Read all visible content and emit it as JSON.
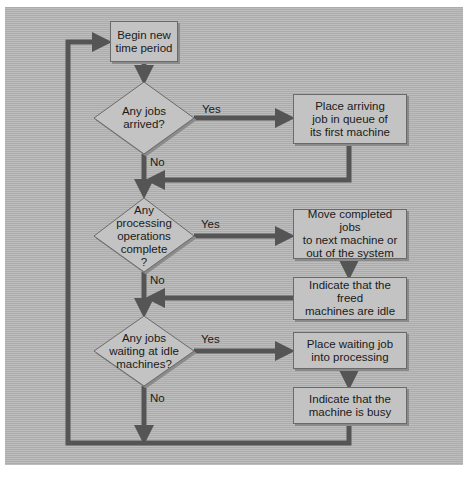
{
  "diagram": {
    "type": "flowchart",
    "colors": {
      "background": "#b4b4b4",
      "box_fill": "#c3c3c3",
      "box_border": "#6a6a6a",
      "connector": "#555555",
      "text": "#1a1a1a"
    },
    "nodes": {
      "start": {
        "shape": "rectangle",
        "text": "Begin new\ntime period"
      },
      "decision1": {
        "shape": "diamond",
        "text": "Any jobs\narrived?"
      },
      "action1": {
        "shape": "rectangle",
        "text": "Place arriving\njob in queue of\nits first machine"
      },
      "decision2": {
        "shape": "diamond",
        "text": "Any\nprocessing\noperations\ncomplete\n?"
      },
      "action2a": {
        "shape": "rectangle",
        "text": "Move completed jobs\nto next machine or\nout of the system"
      },
      "action2b": {
        "shape": "rectangle",
        "text": "Indicate that the freed\nmachines are idle"
      },
      "decision3": {
        "shape": "diamond",
        "text": "Any jobs\nwaiting at idle\nmachines?"
      },
      "action3a": {
        "shape": "rectangle",
        "text": "Place waiting job\ninto processing"
      },
      "action3b": {
        "shape": "rectangle",
        "text": "Indicate that the\nmachine is busy"
      }
    },
    "edge_labels": {
      "d1_yes": "Yes",
      "d1_no": "No",
      "d2_yes": "Yes",
      "d2_no": "No",
      "d3_yes": "Yes",
      "d3_no": "No"
    },
    "edges": [
      {
        "from": "start",
        "to": "decision1"
      },
      {
        "from": "decision1",
        "to": "action1",
        "label": "Yes"
      },
      {
        "from": "decision1",
        "to": "decision2",
        "label": "No"
      },
      {
        "from": "action1",
        "to": "decision2"
      },
      {
        "from": "decision2",
        "to": "action2a",
        "label": "Yes"
      },
      {
        "from": "action2a",
        "to": "action2b"
      },
      {
        "from": "decision2",
        "to": "decision3",
        "label": "No"
      },
      {
        "from": "action2b",
        "to": "decision3"
      },
      {
        "from": "decision3",
        "to": "action3a",
        "label": "Yes"
      },
      {
        "from": "action3a",
        "to": "action3b"
      },
      {
        "from": "decision3",
        "to": "start",
        "label": "No"
      },
      {
        "from": "action3b",
        "to": "start"
      }
    ]
  }
}
